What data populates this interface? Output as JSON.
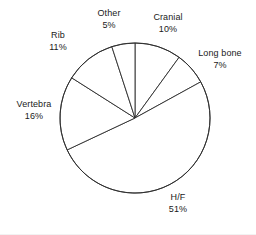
{
  "chart_data": {
    "type": "pie",
    "title": "",
    "subtitle": "",
    "xlabel": "",
    "ylabel": "",
    "legend_position": "none",
    "grid": false,
    "start_angle_deg": 0,
    "direction": "clockwise",
    "units": "percent",
    "categories": [
      "Cranial",
      "Long bone",
      "H/F",
      "Vertebra",
      "Rib",
      "Other"
    ],
    "values": [
      10,
      7,
      51,
      16,
      11,
      5
    ],
    "labels": [
      {
        "name": "Cranial",
        "pct": "10%",
        "value": 10
      },
      {
        "name": "Long bone",
        "pct": "7%",
        "value": 7
      },
      {
        "name": "H/F",
        "pct": "51%",
        "value": 51
      },
      {
        "name": "Vertebra",
        "pct": "16%",
        "value": 16
      },
      {
        "name": "Rib",
        "pct": "11%",
        "value": 11
      },
      {
        "name": "Other",
        "pct": "5%",
        "value": 5
      }
    ],
    "slice_fill": "#ffffff",
    "slice_stroke": "#2b2b2b",
    "text_color": "#1a1a1a"
  },
  "geometry": {
    "center_x": 135,
    "center_y": 118,
    "radius": 75
  }
}
